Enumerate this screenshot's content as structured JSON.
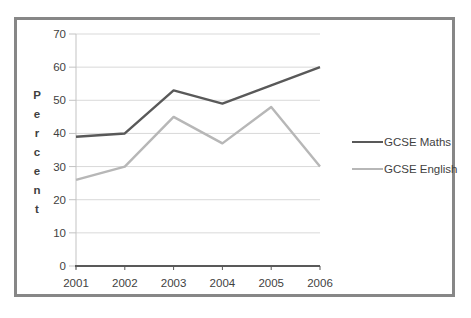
{
  "window": {
    "background_color": "#ffffff",
    "frame_border_color": "#878787"
  },
  "chart_data": {
    "type": "line",
    "title": "",
    "categories": [
      "2001",
      "2002",
      "2003",
      "2004",
      "2005",
      "2006"
    ],
    "series": [
      {
        "name": "GCSE Maths",
        "color": "#595959",
        "values": [
          39,
          40,
          53,
          49,
          54.5,
          60
        ]
      },
      {
        "name": "GCSE English",
        "color": "#b7b7b7",
        "values": [
          26,
          30,
          45,
          37,
          48,
          30
        ]
      }
    ],
    "xlabel": "",
    "ylabel": "Percent",
    "ylabel_orientation": "stacked-vertical",
    "ylim": [
      0,
      70
    ],
    "yticks": [
      0,
      10,
      20,
      30,
      40,
      50,
      60,
      70
    ],
    "grid": "horizontal",
    "legend_position": "right",
    "colors": {
      "gridline": "#d9d9d9",
      "axis_line": "#595959",
      "y_axis_line": "#c3c3c3",
      "tick_text": "#3f3f3f"
    }
  }
}
